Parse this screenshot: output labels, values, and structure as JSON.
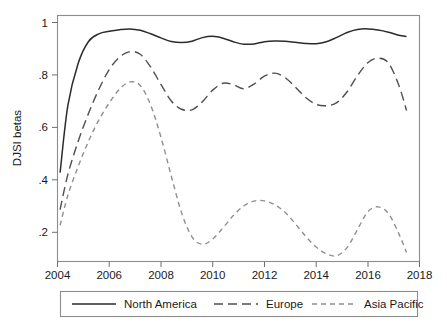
{
  "chart_data": {
    "type": "line",
    "title": "",
    "subtitle": "",
    "xlabel": "",
    "ylabel": "DJSI betas",
    "xlim": [
      2004,
      2018
    ],
    "ylim": [
      0.13,
      1.03
    ],
    "grid": false,
    "legend_position": "bottom",
    "xticks": [
      2004,
      2006,
      2008,
      2010,
      2012,
      2014,
      2016,
      2018
    ],
    "xtick_labels": [
      "2004",
      "2006",
      "2008",
      "2010",
      "2012",
      "2014",
      "2016",
      "2018"
    ],
    "yticks": [
      0.2,
      0.4,
      0.6,
      0.8,
      1.0
    ],
    "ytick_labels": [
      ".2",
      ".4",
      ".6",
      ".8",
      "1"
    ],
    "x": [
      2004.1,
      2004.4,
      2004.8,
      2005.2,
      2005.6,
      2006.0,
      2006.4,
      2006.8,
      2007.2,
      2007.6,
      2008.0,
      2008.4,
      2008.8,
      2009.2,
      2009.6,
      2010.0,
      2010.4,
      2010.8,
      2011.2,
      2011.6,
      2012.0,
      2012.4,
      2012.8,
      2013.2,
      2013.6,
      2014.0,
      2014.4,
      2014.8,
      2015.2,
      2015.6,
      2016.0,
      2016.4,
      2016.8,
      2017.2,
      2017.5
    ],
    "series": [
      {
        "name": "North America",
        "style": "solid",
        "color": "#2b2b2b",
        "values": [
          0.455,
          0.7,
          0.855,
          0.935,
          0.963,
          0.972,
          0.978,
          0.981,
          0.976,
          0.963,
          0.948,
          0.935,
          0.931,
          0.936,
          0.949,
          0.954,
          0.947,
          0.934,
          0.925,
          0.926,
          0.934,
          0.937,
          0.936,
          0.932,
          0.928,
          0.927,
          0.934,
          0.95,
          0.968,
          0.979,
          0.981,
          0.977,
          0.969,
          0.958,
          0.953
        ]
      },
      {
        "name": "Europe",
        "style": "dashed-long",
        "color": "#4f4f4f",
        "values": [
          0.32,
          0.448,
          0.57,
          0.672,
          0.76,
          0.832,
          0.878,
          0.898,
          0.888,
          0.842,
          0.778,
          0.717,
          0.687,
          0.685,
          0.714,
          0.757,
          0.782,
          0.777,
          0.762,
          0.779,
          0.808,
          0.819,
          0.803,
          0.768,
          0.73,
          0.705,
          0.7,
          0.711,
          0.751,
          0.81,
          0.857,
          0.874,
          0.856,
          0.775,
          0.682
        ]
      },
      {
        "name": "Asia Pacific",
        "style": "dashed-short",
        "color": "#8f8f8f",
        "values": [
          0.262,
          0.372,
          0.478,
          0.57,
          0.648,
          0.71,
          0.761,
          0.787,
          0.774,
          0.703,
          0.585,
          0.443,
          0.308,
          0.22,
          0.193,
          0.212,
          0.253,
          0.298,
          0.333,
          0.351,
          0.352,
          0.338,
          0.31,
          0.268,
          0.222,
          0.183,
          0.158,
          0.151,
          0.181,
          0.247,
          0.312,
          0.33,
          0.305,
          0.232,
          0.163
        ]
      }
    ],
    "legend_entries": [
      {
        "label": "North America",
        "style": "solid",
        "color": "#2b2b2b"
      },
      {
        "label": "Europe",
        "style": "dashed-long",
        "color": "#4f4f4f"
      },
      {
        "label": "Asia Pacific",
        "style": "dashed-short",
        "color": "#8f8f8f"
      }
    ]
  }
}
